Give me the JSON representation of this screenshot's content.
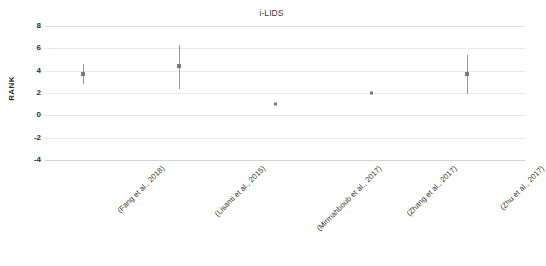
{
  "chart_data": {
    "type": "scatter",
    "title": "i-LIDS",
    "xlabel": "",
    "ylabel": "RANK",
    "ylim": [
      -4,
      8
    ],
    "yticks": [
      8,
      6,
      4,
      2,
      0,
      -2,
      -4
    ],
    "grid": true,
    "legend": "none",
    "categories": [
      "(Fang et al., 2018)",
      "(Lisanti et al., 2015)",
      "(Mirmahboub et al., 2017)",
      "(Zhang et al., 2017)",
      "(Zhu et al., 2017)"
    ],
    "values": [
      3.7,
      4.4,
      1.0,
      2.0,
      3.7
    ],
    "error_low": [
      2.8,
      2.4,
      null,
      null,
      1.9
    ],
    "error_high": [
      4.6,
      6.3,
      null,
      null,
      5.4
    ],
    "points": [
      {
        "category": "(Fang et al., 2018)",
        "value": 3.7,
        "low": 2.8,
        "high": 4.6,
        "has_errorbar": true
      },
      {
        "category": "(Lisanti et al., 2015)",
        "value": 4.4,
        "low": 2.4,
        "high": 6.3,
        "has_errorbar": true
      },
      {
        "category": "(Mirmahboub et al., 2017)",
        "value": 1.0,
        "low": null,
        "high": null,
        "has_errorbar": false
      },
      {
        "category": "(Zhang et al., 2017)",
        "value": 2.0,
        "low": null,
        "high": null,
        "has_errorbar": false
      },
      {
        "category": "(Zhu et al., 2017)",
        "value": 3.7,
        "low": 1.9,
        "high": 5.4,
        "has_errorbar": true
      }
    ],
    "colors": {
      "marker": "#7b7b7b",
      "whisker": "#949494",
      "gridline": "#e9e9e9",
      "text": "#2b2b2b"
    }
  }
}
